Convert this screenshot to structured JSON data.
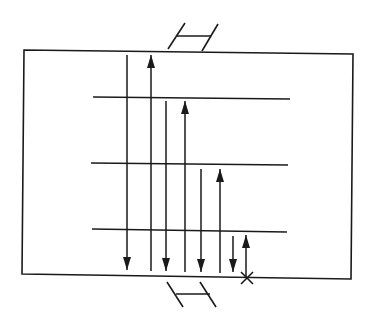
{
  "diagram": {
    "colors": {
      "stroke": "#1a1a1a",
      "background": "#ffffff"
    },
    "box": {
      "tl": [
        24,
        50
      ],
      "tr": [
        353,
        54
      ],
      "br": [
        351,
        279
      ],
      "bl": [
        22,
        274
      ]
    },
    "horizontal_lines": [
      {
        "x1": 93,
        "y1": 97,
        "x2": 290,
        "y2": 99
      },
      {
        "x1": 91,
        "y1": 163,
        "x2": 288,
        "y2": 165
      },
      {
        "x1": 92,
        "y1": 229,
        "x2": 287,
        "y2": 232
      }
    ],
    "rays": [
      {
        "x": 127,
        "y_start": 55,
        "y_end": 270,
        "direction": "down"
      },
      {
        "x": 151,
        "y_start": 271,
        "y_end": 55,
        "direction": "up"
      },
      {
        "x": 166,
        "y_start": 101,
        "y_end": 271,
        "direction": "down"
      },
      {
        "x": 185,
        "y_start": 272,
        "y_end": 101,
        "direction": "up"
      },
      {
        "x": 201,
        "y_start": 169,
        "y_end": 272,
        "direction": "down"
      },
      {
        "x": 220,
        "y_start": 273,
        "y_end": 169,
        "direction": "up"
      },
      {
        "x": 233,
        "y_start": 236,
        "y_end": 272,
        "direction": "down"
      },
      {
        "x": 246,
        "y_start": 278,
        "y_end": 235,
        "direction": "up"
      }
    ],
    "exit_mark": {
      "x": 247,
      "y": 278,
      "symbol": "X"
    },
    "top_ladder": {
      "left_leg": [
        [
          168,
          49
        ],
        [
          185,
          23
        ]
      ],
      "right_leg": [
        [
          202,
          51
        ],
        [
          218,
          24
        ]
      ],
      "rung": [
        [
          177,
          36
        ],
        [
          211,
          36
        ]
      ]
    },
    "bottom_ladder": {
      "left_leg": [
        [
          167,
          282
        ],
        [
          183,
          307
        ]
      ],
      "right_leg": [
        [
          200,
          282
        ],
        [
          216,
          307
        ]
      ],
      "rung": [
        [
          176,
          294
        ],
        [
          210,
          294
        ]
      ]
    }
  }
}
